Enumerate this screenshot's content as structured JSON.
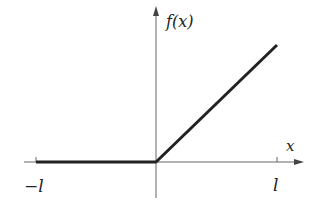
{
  "diagram": {
    "type": "function-graph",
    "y_axis_label": "f(x)",
    "x_axis_label": "x",
    "tick_labels": {
      "left": "−l",
      "right": "l"
    },
    "colors": {
      "axis": "#555555",
      "curve": "#222222",
      "text": "#222222"
    },
    "segments": [
      {
        "from": "-l",
        "to": "0",
        "value": "0"
      },
      {
        "from": "0",
        "to": "l",
        "value": "x (linear increasing)"
      }
    ]
  }
}
